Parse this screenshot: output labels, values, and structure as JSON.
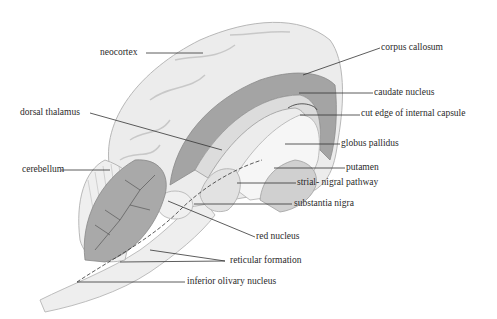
{
  "figure": {
    "labels": {
      "neocortex": "neocortex",
      "corpus_callosum": "corpus callosum",
      "dorsal_thalamus": "dorsal thalamus",
      "caudate_nucleus": "caudate nucleus",
      "cut_edge_internal_capsule": "cut edge of internal capsule",
      "globus_pallidus": "globus pallidus",
      "cerebellum": "cerebellum",
      "putamen": "putamen",
      "strial_nigral_pathway": "strial- nigral pathway",
      "substantia_nigra": "substantia nigra",
      "red_nucleus": "red nucleus",
      "reticular_formation": "reticular formation",
      "inferior_olivary_nucleus": "inferior olivary nucleus"
    },
    "colors": {
      "cortex_fill": "#ececec",
      "cortex_stroke": "#b8b8b8",
      "deep_shade": "#9a9a9a",
      "mid_shade": "#c4c4c4",
      "light_shade": "#f4f4f4",
      "leader_line": "#333333",
      "text": "#2a2a2a"
    }
  }
}
